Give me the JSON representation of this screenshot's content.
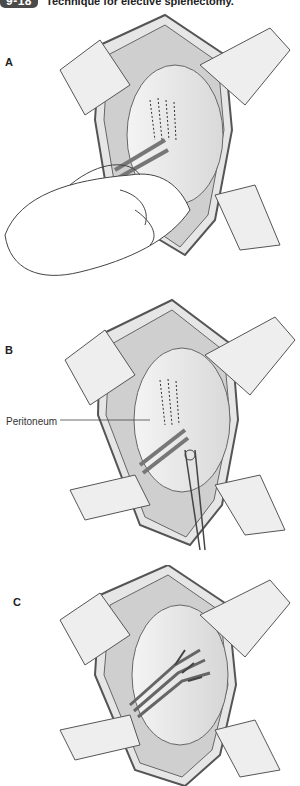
{
  "figure": {
    "number_badge": "9-18",
    "title": "Technique for elective splenectomy.",
    "badge_color": "#4a4a4a"
  },
  "panels": [
    {
      "label": "A",
      "description": "Spleen mobilized by hand traction within retracted abdominal incision"
    },
    {
      "label": "B",
      "description": "Incision of peritoneum with scissors along splenic attachments"
    },
    {
      "label": "C",
      "description": "Splenic hilar vessels exposed and ligated"
    }
  ],
  "callouts": [
    {
      "panel": "B",
      "text": "Peritoneum"
    }
  ]
}
